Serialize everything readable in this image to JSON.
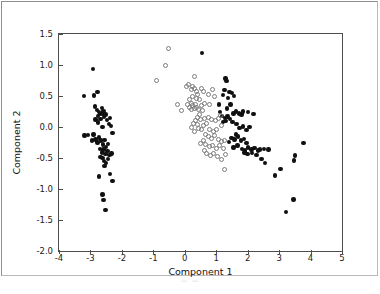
{
  "figure": {
    "caption_artifact": "— —",
    "background_color": "#ffffff",
    "frame_color": "#4d4d4d"
  },
  "chart_data": {
    "type": "scatter",
    "title": "",
    "xlabel": "Component 1",
    "ylabel": "Component 2",
    "xlim": [
      -4,
      5
    ],
    "ylim": [
      -2.0,
      1.5
    ],
    "xticks": [
      -4,
      -3,
      -2,
      -1,
      0,
      1,
      2,
      3,
      4,
      5
    ],
    "yticks": [
      -2.0,
      -1.5,
      -1.0,
      -0.5,
      0.0,
      0.5,
      1.0,
      1.5
    ],
    "xtick_labels": [
      "-4",
      "-3",
      "-2",
      "-1",
      "0",
      "1",
      "2",
      "3",
      "4",
      "5"
    ],
    "ytick_labels": [
      "-2.0",
      "-1.5",
      "-1.0",
      "-0.5",
      "0.0",
      "0.5",
      "1.0",
      "1.5"
    ],
    "grid": false,
    "legend": null,
    "legend_position": "none",
    "marker_styles": {
      "filled": {
        "name": "filled-black-dot",
        "color": "#101010",
        "fill": "#101010",
        "edge": "#101010",
        "size": 4.4
      },
      "open": {
        "name": "open-gray-circle",
        "color": "#7b7b7b",
        "fill": "none",
        "edge": "#7b7b7b",
        "size": 5.0
      }
    },
    "series": [
      {
        "name": "filled",
        "marker": "filled",
        "points": [
          [
            -3.21,
            0.5
          ],
          [
            -3.19,
            -0.14
          ],
          [
            -2.92,
            0.94
          ],
          [
            -2.88,
            0.51
          ],
          [
            -2.77,
            0.56
          ],
          [
            -2.86,
            0.33
          ],
          [
            -2.8,
            0.27
          ],
          [
            -2.73,
            0.24
          ],
          [
            -2.7,
            0.21
          ],
          [
            -2.76,
            0.18
          ],
          [
            -2.68,
            0.13
          ],
          [
            -2.62,
            0.22
          ],
          [
            -2.58,
            0.26
          ],
          [
            -2.64,
            0.31
          ],
          [
            -2.56,
            0.16
          ],
          [
            -2.52,
            0.2
          ],
          [
            -2.47,
            0.11
          ],
          [
            -2.41,
            0.05
          ],
          [
            -2.38,
            0.15
          ],
          [
            -2.3,
            -0.1
          ],
          [
            -2.9,
            -0.12
          ],
          [
            -2.84,
            -0.2
          ],
          [
            -2.78,
            -0.25
          ],
          [
            -2.72,
            -0.17
          ],
          [
            -2.66,
            -0.22
          ],
          [
            -2.6,
            -0.28
          ],
          [
            -2.55,
            -0.21
          ],
          [
            -2.5,
            -0.32
          ],
          [
            -2.45,
            -0.27
          ],
          [
            -2.58,
            -0.36
          ],
          [
            -2.64,
            -0.41
          ],
          [
            -2.7,
            -0.35
          ],
          [
            -2.52,
            -0.44
          ],
          [
            -2.46,
            -0.39
          ],
          [
            -2.39,
            -0.45
          ],
          [
            -2.33,
            -0.43
          ],
          [
            -3.08,
            -0.13
          ],
          [
            -2.96,
            -0.22
          ],
          [
            -2.62,
            -0.5
          ],
          [
            -2.56,
            -0.55
          ],
          [
            -2.5,
            -0.58
          ],
          [
            -2.55,
            -0.63
          ],
          [
            -2.68,
            -0.48
          ],
          [
            -2.44,
            -0.52
          ],
          [
            -2.72,
            -0.8
          ],
          [
            -2.38,
            -0.76
          ],
          [
            -2.3,
            -0.87
          ],
          [
            -2.62,
            -1.09
          ],
          [
            -2.58,
            -1.18
          ],
          [
            -2.52,
            -1.34
          ],
          [
            -2.76,
            0.07
          ],
          [
            -2.62,
            0.0
          ],
          [
            -2.34,
            0.02
          ],
          [
            -2.84,
            0.12
          ],
          [
            0.55,
            1.19
          ],
          [
            1.3,
            0.78
          ],
          [
            1.33,
            0.74
          ],
          [
            1.26,
            0.6
          ],
          [
            1.42,
            0.56
          ],
          [
            1.5,
            0.55
          ],
          [
            1.57,
            0.5
          ],
          [
            1.38,
            0.47
          ],
          [
            1.22,
            0.52
          ],
          [
            1.08,
            0.36
          ],
          [
            1.45,
            0.36
          ],
          [
            1.35,
            0.3
          ],
          [
            1.55,
            0.22
          ],
          [
            1.62,
            0.25
          ],
          [
            1.72,
            0.22
          ],
          [
            1.8,
            0.2
          ],
          [
            1.86,
            0.25
          ],
          [
            2.02,
            0.24
          ],
          [
            1.18,
            0.18
          ],
          [
            1.28,
            0.15
          ],
          [
            1.36,
            0.17
          ],
          [
            1.44,
            0.13
          ],
          [
            1.3,
            0.1
          ],
          [
            1.22,
            0.08
          ],
          [
            1.52,
            0.08
          ],
          [
            1.65,
            0.05
          ],
          [
            1.74,
            -0.02
          ],
          [
            1.86,
            0.01
          ],
          [
            1.96,
            -0.05
          ],
          [
            2.06,
            0.0
          ],
          [
            1.62,
            -0.12
          ],
          [
            1.7,
            -0.15
          ],
          [
            1.58,
            -0.2
          ],
          [
            1.48,
            -0.18
          ],
          [
            1.4,
            -0.24
          ],
          [
            1.78,
            -0.22
          ],
          [
            1.88,
            -0.19
          ],
          [
            1.96,
            -0.26
          ],
          [
            1.68,
            -0.3
          ],
          [
            1.55,
            -0.33
          ],
          [
            1.82,
            -0.35
          ],
          [
            1.92,
            -0.38
          ],
          [
            2.02,
            -0.33
          ],
          [
            2.12,
            -0.36
          ],
          [
            2.22,
            -0.34
          ],
          [
            2.32,
            -0.38
          ],
          [
            2.14,
            -0.42
          ],
          [
            2.0,
            -0.44
          ],
          [
            1.9,
            -0.41
          ],
          [
            2.28,
            -0.45
          ],
          [
            2.4,
            -0.36
          ],
          [
            2.52,
            -0.35
          ],
          [
            2.44,
            -0.52
          ],
          [
            2.56,
            -0.58
          ],
          [
            2.86,
            -0.78
          ],
          [
            3.04,
            -0.68
          ],
          [
            3.22,
            -1.37
          ],
          [
            3.46,
            -1.17
          ],
          [
            3.48,
            -0.54
          ],
          [
            3.5,
            -0.46
          ],
          [
            3.78,
            -0.26
          ],
          [
            2.66,
            -0.36
          ],
          [
            1.12,
            0.24
          ],
          [
            2.18,
            0.21
          ]
        ]
      },
      {
        "name": "open",
        "marker": "open",
        "points": [
          [
            -0.52,
            1.26
          ],
          [
            -0.62,
            1.0
          ],
          [
            -0.9,
            0.75
          ],
          [
            -0.22,
            0.36
          ],
          [
            -0.1,
            0.26
          ],
          [
            0.06,
            0.66
          ],
          [
            0.12,
            0.68
          ],
          [
            0.2,
            0.6
          ],
          [
            0.24,
            0.66
          ],
          [
            0.3,
            0.62
          ],
          [
            0.36,
            0.58
          ],
          [
            0.42,
            0.52
          ],
          [
            0.3,
            0.82
          ],
          [
            0.52,
            0.62
          ],
          [
            0.6,
            0.58
          ],
          [
            0.74,
            0.52
          ],
          [
            0.88,
            0.6
          ],
          [
            0.26,
            0.5
          ],
          [
            0.36,
            0.46
          ],
          [
            0.46,
            0.44
          ],
          [
            0.14,
            0.44
          ],
          [
            0.2,
            0.38
          ],
          [
            0.26,
            0.34
          ],
          [
            0.3,
            0.3
          ],
          [
            0.34,
            0.36
          ],
          [
            0.38,
            0.32
          ],
          [
            0.22,
            0.28
          ],
          [
            0.16,
            0.32
          ],
          [
            0.1,
            0.36
          ],
          [
            0.44,
            0.28
          ],
          [
            0.52,
            0.34
          ],
          [
            0.62,
            0.38
          ],
          [
            0.78,
            0.36
          ],
          [
            0.94,
            0.5
          ],
          [
            0.56,
            0.26
          ],
          [
            0.48,
            0.2
          ],
          [
            0.4,
            0.16
          ],
          [
            0.34,
            0.1
          ],
          [
            0.28,
            0.06
          ],
          [
            0.5,
            0.12
          ],
          [
            0.62,
            0.14
          ],
          [
            0.74,
            0.16
          ],
          [
            0.86,
            0.12
          ],
          [
            0.98,
            0.1
          ],
          [
            1.06,
            0.14
          ],
          [
            1.14,
            0.18
          ],
          [
            0.7,
            0.06
          ],
          [
            0.6,
            0.02
          ],
          [
            0.52,
            -0.04
          ],
          [
            0.44,
            -0.02
          ],
          [
            0.8,
            -0.04
          ],
          [
            0.92,
            -0.08
          ],
          [
            1.02,
            -0.04
          ],
          [
            0.66,
            -0.12
          ],
          [
            0.74,
            -0.16
          ],
          [
            0.84,
            -0.18
          ],
          [
            0.94,
            -0.14
          ],
          [
            1.06,
            -0.2
          ],
          [
            1.16,
            -0.24
          ],
          [
            1.26,
            -0.22
          ],
          [
            0.58,
            -0.22
          ],
          [
            0.5,
            -0.26
          ],
          [
            0.66,
            -0.28
          ],
          [
            0.78,
            -0.32
          ],
          [
            0.88,
            -0.3
          ],
          [
            1.0,
            -0.34
          ],
          [
            1.1,
            -0.3
          ],
          [
            1.22,
            -0.35
          ],
          [
            0.92,
            -0.42
          ],
          [
            0.82,
            -0.46
          ],
          [
            1.04,
            -0.48
          ],
          [
            1.18,
            -0.52
          ],
          [
            0.7,
            -0.42
          ],
          [
            0.62,
            -0.38
          ],
          [
            1.3,
            -0.44
          ],
          [
            1.26,
            -0.69
          ],
          [
            0.3,
            -0.08
          ],
          [
            0.22,
            0.0
          ],
          [
            0.42,
            0.04
          ],
          [
            1.16,
            0.02
          ]
        ]
      }
    ]
  }
}
